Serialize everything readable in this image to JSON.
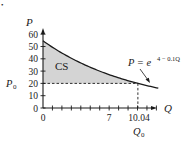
{
  "chart_data": {
    "type": "area",
    "title": "",
    "xlabel": "Q",
    "ylabel": "P",
    "xlim": [
      0,
      12.2
    ],
    "ylim": [
      0,
      60
    ],
    "y_ticks": [
      0,
      10,
      20,
      30,
      40,
      50,
      60
    ],
    "x_tick_labels": [
      "0",
      "7",
      "10.04"
    ],
    "x_minor_ticks_count": 12,
    "grid": false,
    "curve": {
      "equation_label": "P = e^(4 − 0.1Q)",
      "equation_base": "P = e",
      "equation_exponent": "4 − 0.1Q",
      "function": "exp(4 - 0.1*Q)",
      "q_start": 0,
      "q_end": 12.2,
      "points": [
        [
          0,
          54.6
        ],
        [
          2,
          44.7
        ],
        [
          4,
          36.6
        ],
        [
          6,
          30.0
        ],
        [
          7,
          27.1
        ],
        [
          8,
          24.5
        ],
        [
          10,
          20.1
        ],
        [
          10.04,
          20.0
        ],
        [
          12,
          16.4
        ]
      ]
    },
    "shaded_region": {
      "label": "CS",
      "description": "Consumer surplus: area between demand curve and P0 from Q=0 to Q0",
      "q_from": 0,
      "q_to": 10.04,
      "lower_bound_p": 20
    },
    "reference_lines": [
      {
        "type": "horizontal",
        "value": 20,
        "label": "P0",
        "style": "dashed"
      },
      {
        "type": "vertical",
        "value": 10.04,
        "label": "Q0",
        "style": "dashed"
      }
    ],
    "p0_label": "P",
    "p0_sub": "0",
    "q0_label": "Q",
    "q0_sub": "0",
    "colors": {
      "curve": "#1a1a1a",
      "shade": "#d4d4d4",
      "axes": "#1a1a1a"
    }
  },
  "labels": {
    "y_axis": "P",
    "x_axis": "Q",
    "cs": "CS",
    "y_ticks": [
      "0",
      "10",
      "20",
      "30",
      "40",
      "50",
      "60"
    ],
    "x_ticks": [
      "0",
      "7",
      "10.04"
    ],
    "eq_base": "P = e",
    "eq_exp": "4 − 0.1Q",
    "p0_main": "P",
    "p0_sub": "0",
    "q0_main": "Q",
    "q0_sub": "0",
    "corner_dot": "•"
  }
}
